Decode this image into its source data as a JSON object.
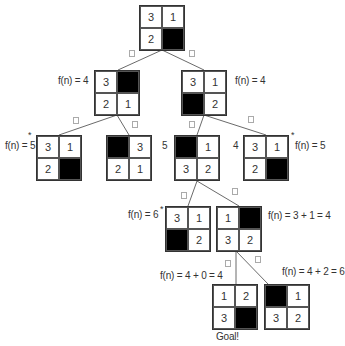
{
  "diagram": {
    "title": "",
    "nodes": [
      {
        "id": "root",
        "tiles": [
          "3",
          "1",
          "2",
          ""
        ],
        "x": 139,
        "y": 5
      },
      {
        "id": "l1a",
        "tiles": [
          "3",
          "",
          "2",
          "1"
        ],
        "x": 94,
        "y": 70,
        "fn": "f(n) = 4"
      },
      {
        "id": "l1b",
        "tiles": [
          "3",
          "1",
          "",
          "2"
        ],
        "x": 181,
        "y": 70,
        "fn": "f(n) = 4"
      },
      {
        "id": "l2a",
        "tiles": [
          "3",
          "1",
          "2",
          ""
        ],
        "x": 36,
        "y": 135,
        "fn": "f(n) = 5",
        "star": true
      },
      {
        "id": "l2b",
        "tiles": [
          "",
          "3",
          "2",
          "1"
        ],
        "x": 106,
        "y": 135
      },
      {
        "id": "l2c",
        "tiles": [
          "",
          "1",
          "3",
          "2"
        ],
        "x": 174,
        "y": 135,
        "fn": "5"
      },
      {
        "id": "l2d",
        "tiles": [
          "3",
          "1",
          "2",
          ""
        ],
        "x": 243,
        "y": 135,
        "fn": "4",
        "fn2": "f(n) = 5",
        "star": true
      },
      {
        "id": "l3a",
        "tiles": [
          "3",
          "1",
          "",
          "2"
        ],
        "x": 165,
        "y": 206,
        "fn": "f(n) = 6",
        "star": true
      },
      {
        "id": "l3b",
        "tiles": [
          "1",
          "",
          "3",
          "2"
        ],
        "x": 216,
        "y": 206,
        "fn": "f(n) = 3 + 1 = 4"
      },
      {
        "id": "l4a",
        "tiles": [
          "1",
          "2",
          "3",
          ""
        ],
        "x": 212,
        "y": 284,
        "fn": "f(n) = 4 + 0 = 4",
        "caption": "Goal!"
      },
      {
        "id": "l4b",
        "tiles": [
          "",
          "1",
          "3",
          "2"
        ],
        "x": 264,
        "y": 284,
        "fn": "f(n) = 4 + 2 = 6"
      }
    ],
    "labels": {
      "l1a_fn": "f(n) = 4",
      "l1b_fn": "f(n) = 4",
      "l2a_fn": "f(n) = 5",
      "l2c_fn": "5",
      "l2d_left": "4",
      "l2d_fn": "f(n) = 5",
      "l3a_fn": "f(n) = 6",
      "l3b_fn": "f(n) = 3 + 1 = 4",
      "l4a_fn": "f(n) = 4 + 0 = 4",
      "l4b_fn": "f(n) = 4 + 2 = 6",
      "goal": "Goal!",
      "star": "*"
    },
    "root": [
      "3",
      "1",
      "2",
      ""
    ],
    "l1a": [
      "3",
      "",
      "2",
      "1"
    ],
    "l1b": [
      "3",
      "1",
      "",
      "2"
    ],
    "l2a": [
      "3",
      "1",
      "2",
      ""
    ],
    "l2b": [
      "",
      "3",
      "2",
      "1"
    ],
    "l2c": [
      "",
      "1",
      "3",
      "2"
    ],
    "l2d": [
      "3",
      "1",
      "2",
      ""
    ],
    "l3a": [
      "3",
      "1",
      "",
      "2"
    ],
    "l3b": [
      "1",
      "",
      "3",
      "2"
    ],
    "l4a": [
      "1",
      "2",
      "3",
      ""
    ],
    "l4b": [
      "",
      "1",
      "3",
      "2"
    ],
    "colors": {
      "blank_tile": "#000000",
      "line": "#333333",
      "marker": "#aaaaaa"
    }
  }
}
